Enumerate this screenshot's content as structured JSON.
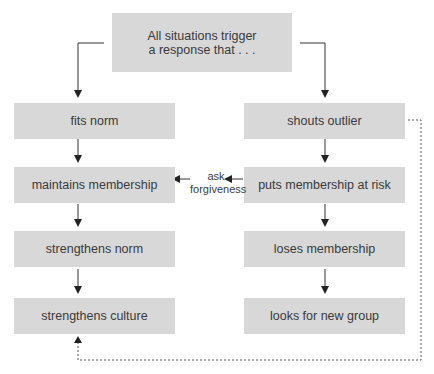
{
  "diagram": {
    "root": {
      "label": "All situations trigger\na response that . . ."
    },
    "left_branch": [
      {
        "label": "fits norm"
      },
      {
        "label": "maintains membership"
      },
      {
        "label": "strengthens norm"
      },
      {
        "label": "strengthens culture"
      }
    ],
    "right_branch": [
      {
        "label": "shouts outlier"
      },
      {
        "label": "puts membership at risk"
      },
      {
        "label": "loses membership"
      },
      {
        "label": "looks for new group"
      }
    ],
    "cross_link": {
      "label": "ask\nforgiveness",
      "from": "puts membership at risk",
      "to": "maintains membership"
    },
    "feedback_link": {
      "style": "dashed",
      "from": "shouts outlier",
      "to": "strengthens culture"
    },
    "colors": {
      "box_fill": "#d8d8d8",
      "text": "#3a3a3a",
      "line": "#222222"
    }
  }
}
